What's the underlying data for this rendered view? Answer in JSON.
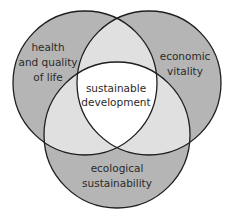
{
  "diagram": {
    "type": "venn",
    "colors": {
      "outer": "#b5b5b5",
      "pair_overlap": "#e0e0e0",
      "center": "#ffffff",
      "stroke": "#1e1e1e",
      "text": "#2a2a2a"
    },
    "circles": [
      {
        "id": "health",
        "cx": 85,
        "cy": 83,
        "r": 72,
        "label_lines": [
          "health",
          "and quality",
          "of life"
        ]
      },
      {
        "id": "economic",
        "cx": 149,
        "cy": 83,
        "r": 72,
        "label_lines": [
          "economic",
          "vitality"
        ]
      },
      {
        "id": "ecological",
        "cx": 117,
        "cy": 135,
        "r": 73,
        "label_lines": [
          "ecological",
          "sustainability"
        ]
      }
    ],
    "center_label_lines": [
      "sustainable",
      "development"
    ]
  }
}
